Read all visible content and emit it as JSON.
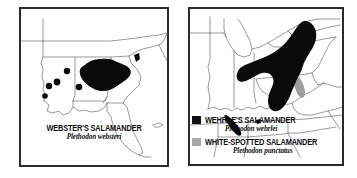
{
  "figure": {
    "type": "range-map-pair",
    "background_color": "#ffffff",
    "frame_color": "#2b2b2b",
    "outline_color": "#6e6e6e",
    "panels": [
      {
        "id": "left",
        "name": "websters-salamander-map",
        "region": "Southeastern United States",
        "legend_style": "caption",
        "entries": [
          {
            "common_name": "WEBSTER'S SALAMANDER",
            "scientific_name": "Plethodon websteri",
            "swatch_color": "#000000",
            "swatch_label": "black-fill"
          }
        ]
      },
      {
        "id": "right",
        "name": "wehrles-and-white-spotted-salamander-map",
        "region": "Central Appalachian and Great Lakes United States",
        "legend_style": "keyed",
        "entries": [
          {
            "common_name": "WEHRLE'S SALAMANDER",
            "scientific_name": "Plethodon wehrlei",
            "swatch_color": "#111111",
            "swatch_label": "black-fill"
          },
          {
            "common_name": "WHITE-SPOTTED SALAMANDER",
            "scientific_name": "Plethodon punctatus",
            "swatch_color": "#a8a8a8",
            "swatch_label": "gray-fill"
          }
        ]
      }
    ]
  }
}
